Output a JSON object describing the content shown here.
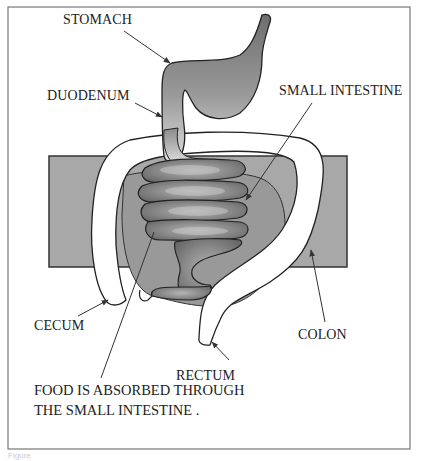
{
  "diagram": {
    "labels": {
      "stomach": "STOMACH",
      "duodenum": "DUODENUM",
      "small_intestine": "SMALL INTESTINE",
      "cecum": "CECUM",
      "colon": "COLON",
      "rectum": "RECTUM"
    },
    "caption": {
      "line1": "FOOD IS ABSORBED THROUGH",
      "line2": "THE SMALL  INTESTINE ."
    },
    "figure_label": "Figure"
  }
}
